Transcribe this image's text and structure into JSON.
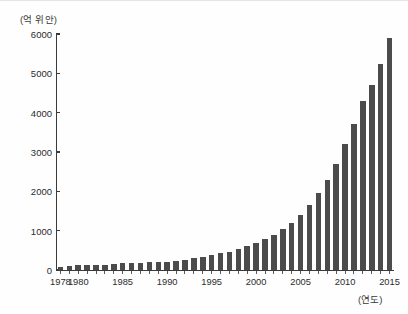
{
  "chart_data": {
    "type": "bar",
    "title": "",
    "subtitle": "",
    "xlabel": "(연도)",
    "ylabel": "(억 위안)",
    "unit_note": "(억 위안)",
    "xlim": [
      1977.3,
      2015.7
    ],
    "ylim": [
      0,
      6000
    ],
    "grid": false,
    "legend": null,
    "bar_color": "#4b4b4b",
    "axis_color": "#3a3a3a",
    "background": "#ffffff",
    "ytick_values": [
      0,
      1000,
      2000,
      3000,
      4000,
      5000,
      6000
    ],
    "ytick_labels": [
      "0",
      "1000",
      "2000",
      "3000",
      "4000",
      "5000",
      "6000"
    ],
    "xtick_values": [
      1978,
      1980,
      1985,
      1990,
      1995,
      2000,
      2005,
      2010,
      2015
    ],
    "xtick_labels": [
      "1978",
      "1980",
      "1985",
      "1990",
      "1995",
      "2000",
      "2005",
      "2010",
      "2015"
    ],
    "categories": [
      "1978",
      "1979",
      "1980",
      "1981",
      "1982",
      "1983",
      "1984",
      "1985",
      "1986",
      "1987",
      "1988",
      "1989",
      "1990",
      "1991",
      "1992",
      "1993",
      "1994",
      "1995",
      "1996",
      "1997",
      "1998",
      "1999",
      "2000",
      "2001",
      "2002",
      "2003",
      "2004",
      "2005",
      "2006",
      "2007",
      "2008",
      "2009",
      "2010",
      "2011",
      "2012",
      "2013",
      "2014",
      "2015"
    ],
    "values": [
      80,
      110,
      130,
      120,
      130,
      140,
      160,
      180,
      170,
      180,
      200,
      200,
      210,
      230,
      260,
      300,
      340,
      380,
      420,
      470,
      530,
      600,
      680,
      780,
      900,
      1040,
      1200,
      1400,
      1650,
      1950,
      2300,
      2700,
      3200,
      3700,
      4300,
      4700,
      5250,
      5900
    ],
    "series": [
      {
        "name": "연간 지출액",
        "values": [
          80,
          110,
          130,
          120,
          130,
          140,
          160,
          180,
          170,
          180,
          200,
          200,
          210,
          230,
          260,
          300,
          340,
          380,
          420,
          470,
          530,
          600,
          680,
          780,
          900,
          1040,
          1200,
          1400,
          1650,
          1950,
          2300,
          2700,
          3200,
          3700,
          4300,
          4700,
          5250,
          5900
        ]
      }
    ]
  }
}
